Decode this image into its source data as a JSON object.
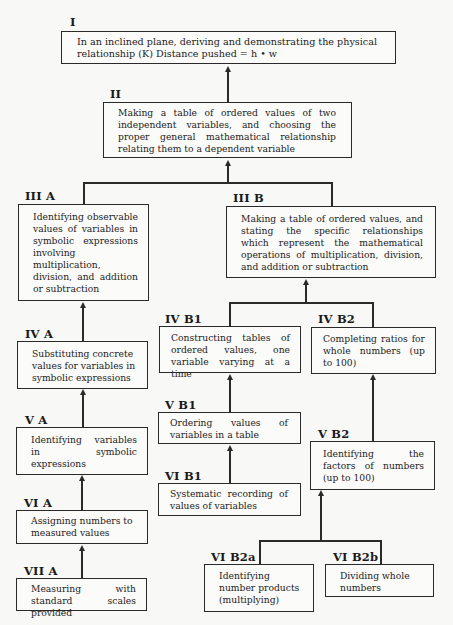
{
  "diagram": {
    "nodes": {
      "I": {
        "label": "I",
        "text": "In an inclined plane, deriving and demonstrating the physical relationship (K) Distance pushed = h • w"
      },
      "II": {
        "label": "II",
        "text": "Making a table of ordered values of two independent variables, and choosing the proper general mathematical relationship relating them to a dependent variable"
      },
      "IIIA": {
        "label": "III A",
        "text": "Identifying observable values of variables in symbolic expressions involving multiplication, division, and addition or subtraction"
      },
      "IIIB": {
        "label": "III B",
        "text": "Making a table of ordered values, and stating the specific relationships which represent the mathematical operations of multiplication, division, and addition or subtraction"
      },
      "IVA": {
        "label": "IV A",
        "text": "Substituting concrete values for variables in symbolic expressions"
      },
      "IVB1": {
        "label": "IV B1",
        "text": "Constructing tables of ordered values, one variable varying at a time"
      },
      "IVB2": {
        "label": "IV B2",
        "text": "Completing ratios for whole numbers (up to 100)"
      },
      "VA": {
        "label": "V A",
        "text": "Identifying variables in symbolic expressions"
      },
      "VB1": {
        "label": "V B1",
        "text": "Ordering values of variables in a table"
      },
      "VB2": {
        "label": "V B2",
        "text": "Identifying the factors of numbers (up to 100)"
      },
      "VIA": {
        "label": "VI A",
        "text": "Assigning numbers to measured values"
      },
      "VIB1": {
        "label": "VI B1",
        "text": "Systematic recording of values of variables"
      },
      "VIB2a": {
        "label": "VI B2a",
        "text": "Identifying number products (multiplying)"
      },
      "VIB2b": {
        "label": "VI B2b",
        "text": "Dividing whole numbers"
      },
      "VIIA": {
        "label": "VII A",
        "text": "Measuring with standard scales provided"
      }
    },
    "edges": [
      [
        "II",
        "I"
      ],
      [
        "IIIA",
        "II"
      ],
      [
        "IIIB",
        "II"
      ],
      [
        "IVA",
        "IIIA"
      ],
      [
        "IVB1",
        "IIIB"
      ],
      [
        "IVB2",
        "IIIB"
      ],
      [
        "VA",
        "IVA"
      ],
      [
        "VB1",
        "IVB1"
      ],
      [
        "VB2",
        "IVB2"
      ],
      [
        "VIA",
        "VA"
      ],
      [
        "VIB1",
        "VB1"
      ],
      [
        "VIB2a",
        "VB2"
      ],
      [
        "VIB2b",
        "VB2"
      ],
      [
        "VIIA",
        "VIA"
      ]
    ]
  }
}
